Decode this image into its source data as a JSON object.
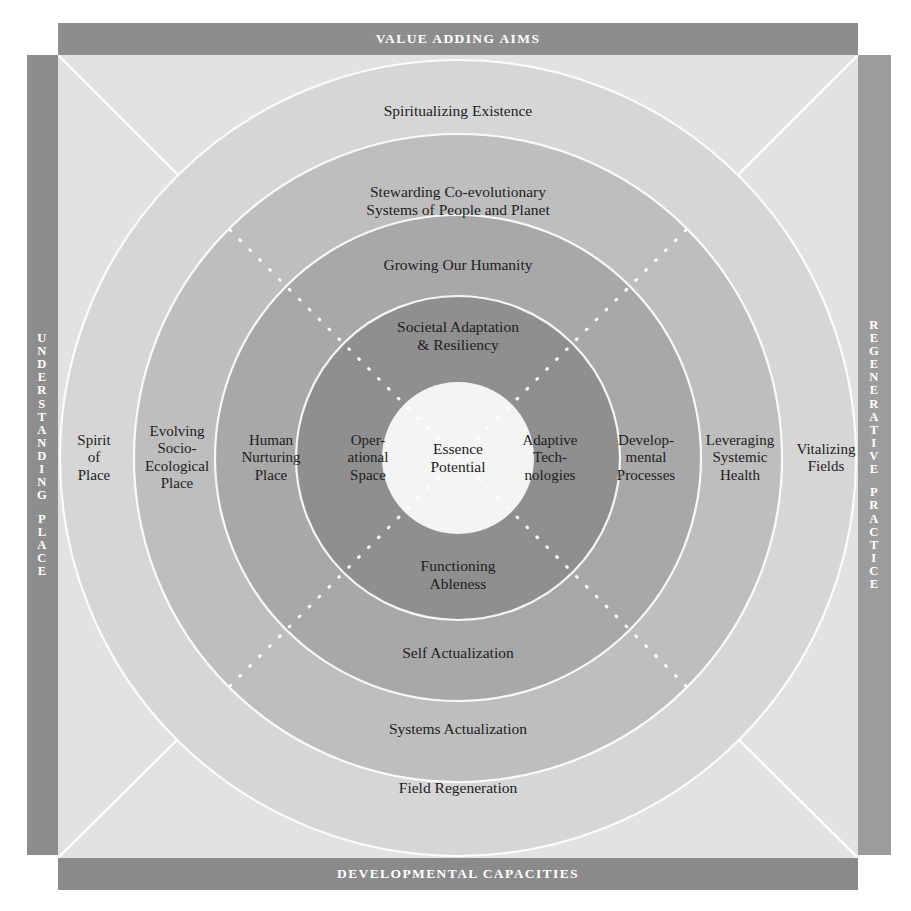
{
  "diagram": {
    "type": "concentric-rings"
  },
  "frame": {
    "top_bar": "VALUE ADDING AIMS",
    "bottom_bar": "DEVELOPMENTAL CAPACITIES",
    "left_bar": "UNDERSTANDING PLACE",
    "right_bar": "REGENERATIVE PRACTICE"
  },
  "core": {
    "label": "Essence\nPotential"
  },
  "rings": [
    {
      "index": 1,
      "name": "ring-1",
      "color": "#8f8f8f",
      "top": "Societal Adaptation\n& Resiliency",
      "bottom": "Functioning\nAbleness",
      "left": "Oper-\national\nSpace",
      "right": "Adaptive\nTech-\nnologies"
    },
    {
      "index": 2,
      "name": "ring-2",
      "color": "#a7a7a7",
      "top": "Growing Our Humanity",
      "bottom": "Self Actualization",
      "left": "Human\nNurturing\nPlace",
      "right": "Develop-\nmental\nProcesses"
    },
    {
      "index": 3,
      "name": "ring-3",
      "color": "#bdbdbd",
      "top": "Stewarding Co-evolutionary\nSystems of People and Planet",
      "bottom": "Systems Actualization",
      "left": "Evolving\nSocio-\nEcological\nPlace",
      "right": "Leveraging\nSystemic\nHealth"
    },
    {
      "index": 4,
      "name": "ring-4",
      "color": "#d6d6d6",
      "top": "Spiritualizing Existence",
      "bottom": "Field Regeneration",
      "left": "Spirit\nof\nPlace",
      "right": "Vitalizing\nFields"
    }
  ],
  "colors": {
    "square_background": "#e2e2e2",
    "bar_grey": "#8d8d8d",
    "bar_grey_right": "#9c9c9c",
    "core_white": "#f4f4f4",
    "divider_white": "#ffffff",
    "text": "#1d1d1d",
    "bar_text": "#ffffff"
  },
  "geometry": {
    "center_x": 406,
    "center_y": 403,
    "core_radius": 76,
    "ring_radii": [
      162,
      243,
      324,
      398
    ]
  }
}
